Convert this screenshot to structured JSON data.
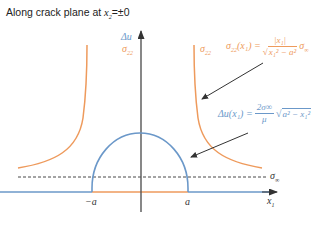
{
  "title": {
    "prefix": "Along crack plane at ",
    "variable": "x",
    "subscript": "2",
    "suffix": "=±0"
  },
  "axes": {
    "y_label_top": "Δu",
    "y_label_bottom": "σ",
    "y_label_bottom_sub": "22",
    "x_label": "x",
    "x_label_sub": "1",
    "tick_neg": "−a",
    "tick_pos": "a",
    "dashed_label": "σ",
    "dashed_label_sub": "∞"
  },
  "curves": {
    "stress_label": "σ",
    "stress_label_sub": "22",
    "opening_label": "Δu"
  },
  "formulas": {
    "stress": {
      "lhs": "σ",
      "lhs_sub": "22",
      "lhs_arg": "(x₁) =",
      "numerator": "|x₁|",
      "denominator": "x₁² − a²",
      "factor": "σ",
      "factor_sub": "∞"
    },
    "opening": {
      "lhs": "Δu(x₁) =",
      "numerator": "2σ∞",
      "denominator": "μ",
      "radical": "a² − x₁²"
    }
  },
  "colors": {
    "stress": "#ee9a5c",
    "opening": "#6b98c9",
    "axis": "#555555",
    "arrow": "#333333"
  }
}
